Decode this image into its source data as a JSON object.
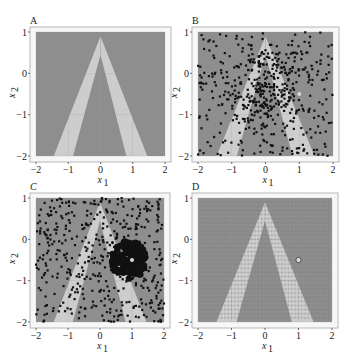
{
  "figure": {
    "width": 346,
    "height": 361,
    "colors": {
      "background_region": "#8e8e8e",
      "stripe_region": "#cdcdcd",
      "frame": "#b8b8b8",
      "points": "#111111",
      "highlight_point": "#d9d9d9",
      "grid": "#9a9a9a"
    }
  },
  "chart_data": [
    {
      "panel": "A",
      "type": "heatmap",
      "title": "A",
      "xlabel": "x1",
      "ylabel": "x2",
      "xlim": [
        -2,
        2
      ],
      "ylim": [
        -2,
        1
      ],
      "xticks": [
        -2,
        -1,
        0,
        1,
        2
      ],
      "yticks": [
        1,
        0,
        -1,
        -2
      ],
      "grid": true,
      "regions": {
        "description": "Inverted-V shaped band (two light stripes meeting at apex near (0,0.9)) on dark background",
        "apex_outer": [
          0,
          0.9
        ],
        "apex_inner": [
          0,
          0.45
        ],
        "bottom_left_outer_x": -1.45,
        "bottom_left_inner_x": -0.85,
        "bottom_right_inner_x": 0.8,
        "bottom_right_outer_x": 1.45
      }
    },
    {
      "panel": "B",
      "type": "scatter",
      "title": "B",
      "xlabel": "x1",
      "ylabel": "x2",
      "xlim": [
        -2,
        2
      ],
      "ylim": [
        -2,
        1
      ],
      "xticks": [
        -2,
        -1,
        0,
        1,
        2
      ],
      "yticks": [
        1,
        0,
        -1,
        -2
      ],
      "series": [
        {
          "name": "samples",
          "n_points": 520,
          "distribution": "spread over domain, denser near x1≈0, x2≈-0.5",
          "center": [
            0,
            -0.4
          ]
        },
        {
          "name": "highlight",
          "points": [
            [
              1.0,
              -0.5
            ]
          ]
        }
      ]
    },
    {
      "panel": "C",
      "type": "scatter",
      "title": "C",
      "xlabel": "x1",
      "ylabel": "x2",
      "xlim": [
        -2,
        2
      ],
      "ylim": [
        -2,
        1
      ],
      "xticks": [
        -2,
        -1,
        0,
        1,
        2
      ],
      "yticks": [
        1,
        0,
        -1,
        -2
      ],
      "series": [
        {
          "name": "samples",
          "n_points": 450,
          "distribution": "spread over domain"
        },
        {
          "name": "cluster",
          "n_points": 120,
          "center": [
            0.9,
            -0.5
          ],
          "radius": 0.55,
          "marker": "large dots"
        },
        {
          "name": "highlight",
          "points": [
            [
              1.0,
              -0.5
            ]
          ]
        }
      ]
    },
    {
      "panel": "D",
      "type": "heatmap",
      "title": "D",
      "xlabel": "x1",
      "ylabel": "x2",
      "xlim": [
        -2,
        2
      ],
      "ylim": [
        -2,
        1
      ],
      "xticks": [
        -2,
        -1,
        0,
        1,
        2
      ],
      "yticks": [
        1,
        0,
        -1,
        -2
      ],
      "grid_markers": {
        "marker": "+",
        "spacing": 0.1
      },
      "series": [
        {
          "name": "highlight",
          "marker": "open circle",
          "points": [
            [
              1.0,
              -0.5
            ]
          ]
        }
      ]
    }
  ],
  "panels": [
    {
      "id": "A",
      "label": "A",
      "left": 36,
      "top": 32,
      "width": 129,
      "height": 124
    },
    {
      "id": "B",
      "label": "B",
      "left": 198,
      "top": 32,
      "width": 135,
      "height": 124
    },
    {
      "id": "C",
      "label": "C",
      "left": 36,
      "top": 198,
      "width": 128,
      "height": 124
    },
    {
      "id": "D",
      "label": "D",
      "left": 198,
      "top": 198,
      "width": 134,
      "height": 124
    }
  ],
  "axis_labels": {
    "x": "x",
    "x_sub": "1",
    "y": "x",
    "y_sub": "2"
  }
}
